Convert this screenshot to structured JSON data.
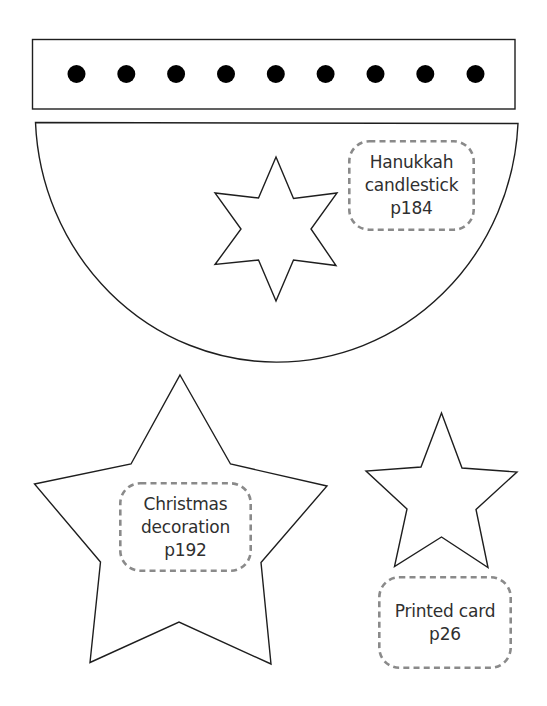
{
  "template": {
    "type": "craft cutout templates",
    "stroke_color": "#1e1e1e",
    "label_border_color": "#8a8a8a",
    "label_text_color": "#2f2f2f"
  },
  "strip": {
    "shape": "rectangle",
    "dot_count": 9,
    "dot_color": "#000000"
  },
  "half_circle": {
    "shape": "semicircle",
    "cutout": "six-pointed-star"
  },
  "labels": {
    "hanukkah": {
      "lines": [
        "Hanukkah",
        "candlestick",
        "p184"
      ]
    },
    "christmas": {
      "lines": [
        "Christmas",
        "decoration",
        "p192"
      ]
    },
    "printed_card": {
      "lines": [
        "Printed card",
        "p26"
      ]
    }
  },
  "large_star": {
    "shape": "five-pointed-star",
    "project": "Christmas decoration"
  },
  "small_star": {
    "shape": "five-pointed-star",
    "project": "Printed card"
  }
}
